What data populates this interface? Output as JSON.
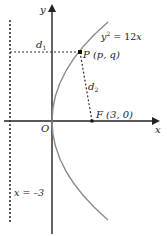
{
  "diagram": {
    "curve_label": "y² = 12x",
    "point_label": "P (p, q)",
    "focus_label": "F (3, 0)",
    "origin_label": "O",
    "x_axis_label": "x",
    "y_axis_label": "y",
    "directrix_label": "x = –3",
    "d1_label": "d",
    "d1_sub": "1",
    "d2_label": "d",
    "d2_sub": "2",
    "colors": {
      "axis": "#222222",
      "curve": "#8a8a8a",
      "dashed": "#333333"
    }
  }
}
